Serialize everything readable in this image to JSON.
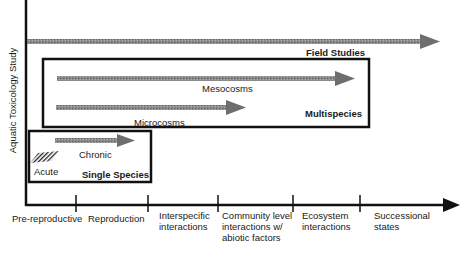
{
  "diagram": {
    "y_axis_label": "Aquatic Toxicology Study",
    "x_axis_categories": [
      {
        "label": "Pre-reproductive"
      },
      {
        "label": "Reproduction"
      },
      {
        "label": "Interspecific\ninteractions"
      },
      {
        "label": "Community level\ninteractions w/\nabiotic factors"
      },
      {
        "label": "Ecosystem\ninteractions"
      },
      {
        "label": "Successional\nstates"
      }
    ],
    "arrows": {
      "field_studies": "Field Studies",
      "mesocosms": "Mesocosms",
      "microcosms": "Microcosms",
      "chronic": "Chronic",
      "acute": "Acute"
    },
    "boxes": {
      "multispecies": "Multispecies",
      "single_species": "Single Species"
    },
    "colors": {
      "axis": "#111111",
      "arrow_fill": "#7a7a7a",
      "box_border": "#111111"
    }
  }
}
